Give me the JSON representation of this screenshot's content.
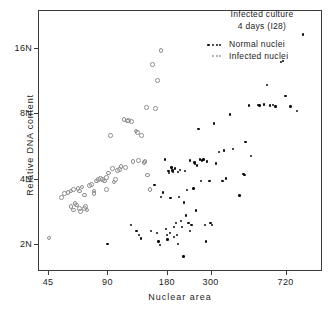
{
  "figure": {
    "title_line1": "Infected culture",
    "title_line2": "4 days (I28)"
  },
  "legend": {
    "entries": [
      {
        "label": "Normal nuclei",
        "symbol": "filled-dot",
        "color": "#0d0d0d"
      },
      {
        "label": "Infected nuclei",
        "symbol": "open-dot",
        "color": "#8e8e8e"
      }
    ]
  },
  "chart_data": {
    "type": "scatter",
    "title": "Infected culture 4 days (I28)",
    "xlabel": "Nuclear area",
    "ylabel": "Relative DNA content",
    "xscale": "log",
    "yscale": "log",
    "grid": false,
    "legend_position": "top-right",
    "xticks": [
      45,
      90,
      180,
      300,
      720
    ],
    "xtick_labels": [
      "45",
      "90",
      "180",
      "300",
      "720"
    ],
    "yticks": [
      2,
      4,
      8,
      16
    ],
    "ytick_labels": [
      "2N",
      "4N",
      "8N",
      "16N"
    ],
    "xlim": [
      40,
      1100
    ],
    "ylim": [
      1.5,
      24
    ],
    "series": [
      {
        "name": "Normal nuclei",
        "marker": "filled-dot",
        "color": "#0d0d0d",
        "points": [
          [
            90,
            2.0
          ],
          [
            118,
            2.45
          ],
          [
            126,
            2.3
          ],
          [
            130,
            2.2
          ],
          [
            133,
            2.12
          ],
          [
            150,
            2.3
          ],
          [
            156,
            3.75
          ],
          [
            160,
            2.25
          ],
          [
            163,
            2.05
          ],
          [
            166,
            1.98
          ],
          [
            168,
            3.3
          ],
          [
            172,
            3.45
          ],
          [
            176,
            4.9
          ],
          [
            178,
            2.35
          ],
          [
            180,
            2.2
          ],
          [
            181,
            2.1
          ],
          [
            183,
            4.35
          ],
          [
            184,
            4.25
          ],
          [
            186,
            2.25
          ],
          [
            188,
            3.25
          ],
          [
            190,
            4.5
          ],
          [
            192,
            4.4
          ],
          [
            193,
            4.3
          ],
          [
            195,
            2.4
          ],
          [
            196,
            2.15
          ],
          [
            198,
            4.45
          ],
          [
            200,
            2.5
          ],
          [
            202,
            2.2
          ],
          [
            205,
            2.0
          ],
          [
            208,
            3.3
          ],
          [
            210,
            4.4
          ],
          [
            212,
            2.55
          ],
          [
            215,
            2.4
          ],
          [
            218,
            1.75
          ],
          [
            220,
            3.1
          ],
          [
            222,
            4.35
          ],
          [
            225,
            2.7
          ],
          [
            228,
            3.55
          ],
          [
            232,
            2.5
          ],
          [
            236,
            4.85
          ],
          [
            240,
            2.45
          ],
          [
            245,
            3.6
          ],
          [
            248,
            4.75
          ],
          [
            252,
            2.85
          ],
          [
            256,
            4.6
          ],
          [
            260,
            6.8
          ],
          [
            265,
            4.9
          ],
          [
            268,
            3.9
          ],
          [
            272,
            4.85
          ],
          [
            276,
            4.9
          ],
          [
            280,
            2.45
          ],
          [
            284,
            2.05
          ],
          [
            288,
            4.8
          ],
          [
            292,
            16.5
          ],
          [
            296,
            3.9
          ],
          [
            300,
            2.5
          ],
          [
            305,
            2.45
          ],
          [
            312,
            7.2
          ],
          [
            320,
            4.7
          ],
          [
            330,
            5.3
          ],
          [
            345,
            3.9
          ],
          [
            360,
            4.0
          ],
          [
            375,
            7.9
          ],
          [
            390,
            5.5
          ],
          [
            420,
            3.35
          ],
          [
            440,
            4.2
          ],
          [
            445,
            4.15
          ],
          [
            450,
            5.9
          ],
          [
            470,
            8.7
          ],
          [
            480,
            5.1
          ],
          [
            520,
            8.75
          ],
          [
            560,
            8.8
          ],
          [
            580,
            10.8
          ],
          [
            600,
            8.7
          ],
          [
            640,
            8.6
          ],
          [
            680,
            13.8
          ],
          [
            700,
            14.0
          ],
          [
            720,
            9.6
          ],
          [
            760,
            8.6
          ],
          [
            820,
            8.2
          ],
          [
            880,
            18.5
          ],
          [
            620,
            8.75
          ],
          [
            530,
            8.7
          ],
          [
            350,
            5.4
          ],
          [
            250,
            4.7
          ],
          [
            235,
            2.3
          ],
          [
            205,
            4.3
          ],
          [
            192,
            4.35
          ]
        ]
      },
      {
        "name": "Infected nuclei",
        "marker": "open-dot",
        "color": "#8e8e8e",
        "points": [
          [
            45,
            2.15
          ],
          [
            52,
            3.3
          ],
          [
            54,
            3.45
          ],
          [
            56,
            3.5
          ],
          [
            58,
            3.55
          ],
          [
            60,
            3.6
          ],
          [
            61,
            3.1
          ],
          [
            62,
            3.05
          ],
          [
            63,
            3.65
          ],
          [
            64,
            2.95
          ],
          [
            65,
            2.85
          ],
          [
            66,
            3.7
          ],
          [
            68,
            3.4
          ],
          [
            69,
            3.0
          ],
          [
            70,
            2.9
          ],
          [
            72,
            3.75
          ],
          [
            74,
            3.8
          ],
          [
            76,
            3.55
          ],
          [
            78,
            3.95
          ],
          [
            80,
            4.0
          ],
          [
            82,
            4.05
          ],
          [
            84,
            4.0
          ],
          [
            86,
            3.95
          ],
          [
            88,
            3.6
          ],
          [
            90,
            4.3
          ],
          [
            92,
            6.4
          ],
          [
            94,
            4.5
          ],
          [
            96,
            3.9
          ],
          [
            98,
            4.0
          ],
          [
            100,
            4.4
          ],
          [
            104,
            4.6
          ],
          [
            108,
            7.6
          ],
          [
            110,
            4.55
          ],
          [
            114,
            7.5
          ],
          [
            118,
            7.4
          ],
          [
            120,
            4.85
          ],
          [
            124,
            6.7
          ],
          [
            126,
            6.6
          ],
          [
            128,
            4.9
          ],
          [
            132,
            6.4
          ],
          [
            136,
            4.8
          ],
          [
            138,
            4.85
          ],
          [
            140,
            8.6
          ],
          [
            142,
            4.2
          ],
          [
            146,
            3.6
          ],
          [
            150,
            13.6
          ],
          [
            156,
            8.5
          ],
          [
            160,
            11.5
          ],
          [
            166,
            15.8
          ],
          [
            112,
            7.45
          ],
          [
            102,
            4.45
          ],
          [
            88,
            4.1
          ],
          [
            76,
            3.45
          ],
          [
            68,
            2.95
          ],
          [
            64,
            3.55
          ],
          [
            60,
            2.9
          ],
          [
            58,
            3.0
          ]
        ]
      }
    ]
  }
}
